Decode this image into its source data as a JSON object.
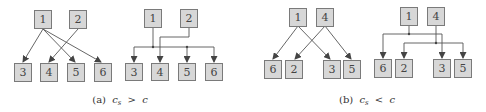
{
  "figure": {
    "subfigures": [
      {
        "id": "a",
        "caption_label": "(a)",
        "caption_math": "c",
        "caption_sub": "s",
        "caption_rel": ">",
        "caption_rhs": "c",
        "diagrams": [
          {
            "style": "direct",
            "sources": [
              "1",
              "2"
            ],
            "targets": [
              "3",
              "4",
              "5",
              "6"
            ],
            "edges": [
              [
                "1",
                "3"
              ],
              [
                "1",
                "5"
              ],
              [
                "1",
                "6"
              ],
              [
                "2",
                "4"
              ]
            ]
          },
          {
            "style": "bus",
            "sources": [
              "1",
              "2"
            ],
            "targets": [
              "3",
              "4",
              "5",
              "6"
            ],
            "edges": [
              [
                "1",
                "3"
              ],
              [
                "1",
                "5"
              ],
              [
                "1",
                "6"
              ],
              [
                "2",
                "4"
              ]
            ]
          }
        ]
      },
      {
        "id": "b",
        "caption_label": "(b)",
        "caption_math": "c",
        "caption_sub": "s",
        "caption_rel": "<",
        "caption_rhs": "c",
        "diagrams": [
          {
            "style": "direct",
            "sources": [
              "1",
              "4"
            ],
            "targets": [
              "6",
              "2",
              "3",
              "5"
            ],
            "edges": [
              [
                "1",
                "6"
              ],
              [
                "1",
                "3"
              ],
              [
                "4",
                "2"
              ],
              [
                "4",
                "5"
              ]
            ]
          },
          {
            "style": "bus",
            "sources": [
              "1",
              "4"
            ],
            "targets": [
              "6",
              "2",
              "3",
              "5"
            ],
            "edges": [
              [
                "1",
                "6"
              ],
              [
                "1",
                "3"
              ],
              [
                "4",
                "2"
              ],
              [
                "4",
                "5"
              ]
            ]
          }
        ]
      }
    ],
    "colors": {
      "box_fill": "#d7d7d7",
      "box_stroke": "#7a7a7a",
      "edge": "#555555"
    }
  }
}
